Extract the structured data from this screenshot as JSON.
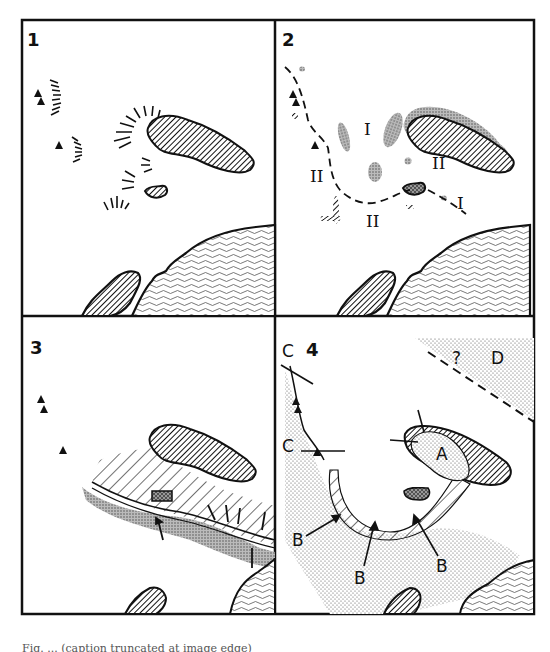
{
  "figure": {
    "panels": [
      {
        "id": "1",
        "label": "1"
      },
      {
        "id": "2",
        "label": "2",
        "zone_labels": [
          "I",
          "II",
          "II",
          "II",
          "I"
        ]
      },
      {
        "id": "3",
        "label": "3"
      },
      {
        "id": "4",
        "label": "4",
        "zone_labels": [
          "A",
          "B",
          "B",
          "B",
          "C",
          "C",
          "D",
          "?",
          "?"
        ]
      }
    ],
    "caption_partial": "Fig. ... (caption truncated at image edge)"
  },
  "colors": {
    "ink": "#111111",
    "paper": "#ffffff",
    "stipple": "#bdbdbd"
  }
}
